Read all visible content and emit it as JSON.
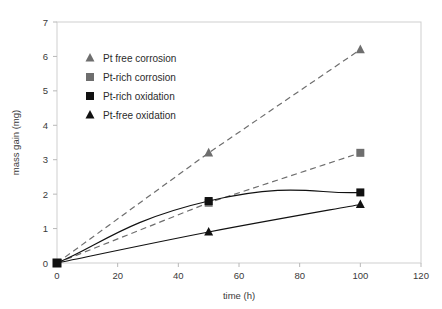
{
  "chart_data": {
    "type": "line",
    "title": "",
    "xlabel": "time (h)",
    "ylabel": "mass gain (mg)",
    "xlim": [
      0,
      120
    ],
    "ylim": [
      0,
      7
    ],
    "xticks": [
      0,
      20,
      40,
      60,
      80,
      100,
      120
    ],
    "yticks": [
      0,
      1,
      2,
      3,
      4,
      5,
      6,
      7
    ],
    "xtick_labels": [
      "0",
      "20",
      "40",
      "60",
      "80",
      "100",
      "120"
    ],
    "ytick_labels": [
      "0",
      "1",
      "2",
      "3",
      "4",
      "5",
      "6",
      "7"
    ],
    "grid": false,
    "legend_position": "upper-left-inside",
    "x": [
      0,
      50,
      100
    ],
    "series": [
      {
        "name": "Pt free corrosion",
        "values": [
          0,
          3.2,
          6.2
        ],
        "marker": "triangle",
        "marker_color": "#6e6e6e",
        "line_style": "dashed",
        "line_color": "#6e6e6e",
        "curve": "linear"
      },
      {
        "name": "Pt-rich corrosion",
        "values": [
          0,
          1.75,
          3.2
        ],
        "marker": "square",
        "marker_color": "#6e6e6e",
        "line_style": "dashed",
        "line_color": "#6e6e6e",
        "curve": "linear"
      },
      {
        "name": "Pt-rich oxidation",
        "values": [
          0,
          1.8,
          2.05
        ],
        "marker": "square",
        "marker_color": "#111111",
        "line_style": "solid",
        "line_color": "#111111",
        "curve": "parabolic"
      },
      {
        "name": "Pt-free oxidation",
        "values": [
          0,
          0.9,
          1.7
        ],
        "marker": "triangle",
        "marker_color": "#111111",
        "line_style": "solid",
        "line_color": "#111111",
        "curve": "slight"
      }
    ]
  },
  "legend": {
    "items": [
      {
        "label": "Pt free corrosion",
        "marker": "triangle",
        "color": "#6e6e6e"
      },
      {
        "label": "Pt-rich corrosion",
        "marker": "square",
        "color": "#6e6e6e"
      },
      {
        "label": "Pt-rich oxidation",
        "marker": "square",
        "color": "#111111"
      },
      {
        "label": "Pt-free oxidation",
        "marker": "triangle",
        "color": "#111111"
      }
    ]
  },
  "axes": {
    "x_title": "time (h)",
    "y_title": "mass gain (mg)"
  }
}
